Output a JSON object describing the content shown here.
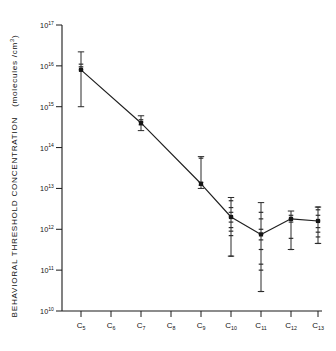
{
  "figure": {
    "background": "#ffffff",
    "ink_color": "#1a1a1a"
  },
  "chart_data": {
    "type": "line",
    "title": "",
    "subtitle": "",
    "xlabel": "",
    "ylabel": "BEHAVIORAL  THRESHOLD  CONCENTRATION",
    "ylabel_units": "(molecules /cm",
    "ylabel_units_exp": "3",
    "ylabel_units_close": ")",
    "yscale": "log",
    "ylim": [
      10000000000.0,
      1e+17
    ],
    "grid": false,
    "legend": null,
    "categories": [
      "C5",
      "C6",
      "C7",
      "C8",
      "C9",
      "C10",
      "C11",
      "C12",
      "C13"
    ],
    "tick_labels_x": [
      {
        "base": "C",
        "sub": "5"
      },
      {
        "base": "C",
        "sub": "6"
      },
      {
        "base": "C",
        "sub": "7"
      },
      {
        "base": "C",
        "sub": "8"
      },
      {
        "base": "C",
        "sub": "9"
      },
      {
        "base": "C",
        "sub": "10"
      },
      {
        "base": "C",
        "sub": "11"
      },
      {
        "base": "C",
        "sub": "12"
      },
      {
        "base": "C",
        "sub": "13"
      }
    ],
    "tick_labels_y": [
      {
        "base": "10",
        "exp": "17",
        "value": 1e+17
      },
      {
        "base": "10",
        "exp": "16",
        "value": 1e+16
      },
      {
        "base": "10",
        "exp": "15",
        "value": 1000000000000000.0
      },
      {
        "base": "10",
        "exp": "14",
        "value": 100000000000000.0
      },
      {
        "base": "10",
        "exp": "13",
        "value": 10000000000000.0
      },
      {
        "base": "10",
        "exp": "12",
        "value": 1000000000000.0
      },
      {
        "base": "10",
        "exp": "11",
        "value": 100000000000.0
      },
      {
        "base": "10",
        "exp": "10",
        "value": 10000000000.0
      }
    ],
    "series": [
      {
        "name": "Behavioral threshold concentration",
        "x": [
          "C5",
          "C7",
          "C9",
          "C10",
          "C11",
          "C12",
          "C13"
        ],
        "values": [
          8000000000000000.0,
          400000000000000.0,
          13000000000000.0,
          2000000000000.0,
          750000000000.0,
          1800000000000.0,
          1600000000000.0
        ],
        "error_high": [
          2.2e+16,
          600000000000000.0,
          60000000000000.0,
          6000000000000.0,
          4500000000000.0,
          2800000000000.0,
          3500000000000.0
        ],
        "error_low": [
          1000000000000000.0,
          260000000000000.0,
          10000000000000.0,
          220000000000.0,
          30000000000.0,
          320000000000.0,
          450000000000.0
        ],
        "marker": "square"
      }
    ],
    "individual_points": {
      "C5": [
        8000000000000000.0,
        9500000000000000.0,
        1.1e+16
      ],
      "C7": [
        360000000000000.0,
        420000000000000.0,
        480000000000000.0
      ],
      "C9": [
        12000000000000.0,
        14000000000000.0,
        55000000000000.0
      ],
      "C10": [
        220000000000.0,
        700000000000.0,
        900000000000.0,
        1100000000000.0,
        1500000000000.0,
        2000000000000.0,
        2600000000000.0,
        3400000000000.0,
        5000000000000.0
      ],
      "C11": [
        30000000000.0,
        100000000000.0,
        140000000000.0,
        320000000000.0,
        550000000000.0,
        750000000000.0,
        1000000000000.0,
        1800000000000.0,
        2600000000000.0
      ],
      "C12": [
        320000000000.0,
        600000000000.0,
        1500000000000.0,
        1800000000000.0,
        2200000000000.0
      ],
      "C13": [
        450000000000.0,
        650000000000.0,
        850000000000.0,
        1100000000000.0,
        1600000000000.0,
        2200000000000.0,
        3000000000000.0,
        3500000000000.0
      ]
    }
  }
}
